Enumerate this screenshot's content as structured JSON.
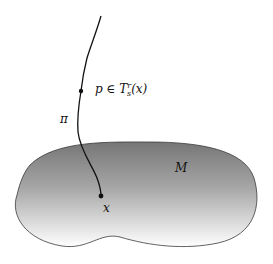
{
  "diagram": {
    "manifold": {
      "label": "M",
      "fill_top": "#7a7a7a",
      "fill_bottom": "#ffffff",
      "stroke": "#333333"
    },
    "curve": {
      "label": "π",
      "stroke": "#111111"
    },
    "points": [
      {
        "name": "p",
        "label_p": "p",
        "label_in": " ∈ ",
        "label_T": "T",
        "label_sub": "s",
        "label_sup": "r",
        "label_arg": "(x)"
      },
      {
        "name": "x",
        "label": "x"
      }
    ]
  }
}
